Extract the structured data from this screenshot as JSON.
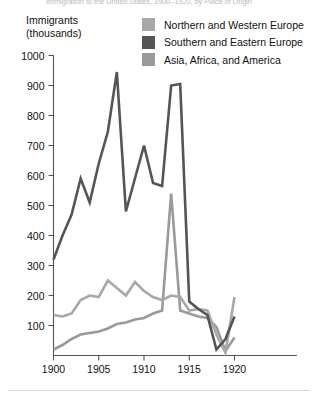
{
  "figure": {
    "clipped_title": "Immigration to the United States, 1900–1920, by Place of Origin",
    "y_axis_caption_line1": "Immigrants",
    "y_axis_caption_line2": "(thousands)"
  },
  "legend": {
    "items": [
      {
        "label": "Northern and Western Europe",
        "color": "#a8a8a8",
        "swatch_name": "legend-swatch-northern-western-europe"
      },
      {
        "label": "Southern and Eastern Europe",
        "color": "#555555",
        "swatch_name": "legend-swatch-southern-eastern-europe"
      },
      {
        "label": "Asia, Africa, and America",
        "color": "#9a9a9a",
        "swatch_name": "legend-swatch-asia-africa-america"
      }
    ]
  },
  "chart_data": {
    "type": "line",
    "title": "Immigration to the United States, 1900–1920, by Place of Origin",
    "xlabel": "",
    "ylabel": "Immigrants (thousands)",
    "xlim": [
      1900,
      1921
    ],
    "ylim": [
      0,
      1000
    ],
    "grid": false,
    "legend_position": "top-right",
    "x_tick_labels": [
      "1900",
      "1905",
      "1910",
      "1915",
      "1920"
    ],
    "x_ticks": [
      1900,
      1905,
      1910,
      1915,
      1920
    ],
    "y_tick_labels": [
      "100",
      "200",
      "300",
      "400",
      "500",
      "600",
      "700",
      "800",
      "900",
      "1000"
    ],
    "y_ticks": [
      100,
      200,
      300,
      400,
      500,
      600,
      700,
      800,
      900,
      1000
    ],
    "x": [
      1900,
      1901,
      1902,
      1903,
      1904,
      1905,
      1906,
      1907,
      1908,
      1909,
      1910,
      1911,
      1912,
      1913,
      1914,
      1915,
      1916,
      1917,
      1918,
      1919,
      1920
    ],
    "series": [
      {
        "name": "Northern and Western Europe",
        "color": "#a8a8a8",
        "values": [
          135,
          130,
          140,
          185,
          200,
          195,
          250,
          225,
          200,
          245,
          215,
          195,
          185,
          200,
          195,
          150,
          155,
          150,
          70,
          10,
          195
        ]
      },
      {
        "name": "Southern and Eastern Europe",
        "color": "#555555",
        "values": [
          320,
          400,
          470,
          590,
          510,
          640,
          745,
          945,
          480,
          590,
          700,
          575,
          565,
          900,
          905,
          180,
          155,
          135,
          20,
          55,
          130
        ]
      },
      {
        "name": "Asia, Africa, and America",
        "color": "#9a9a9a",
        "values": [
          20,
          35,
          55,
          70,
          75,
          80,
          90,
          105,
          110,
          120,
          125,
          140,
          150,
          540,
          150,
          140,
          130,
          125,
          95,
          15,
          60
        ]
      }
    ]
  }
}
